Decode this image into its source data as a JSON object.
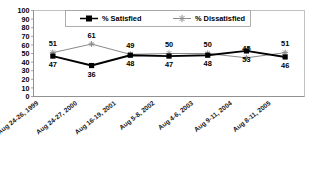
{
  "chart_data": {
    "type": "line",
    "title": "",
    "subtitle": "",
    "xlabel": "",
    "ylabel": "",
    "ylim": [
      0,
      100
    ],
    "ytick_step": 10,
    "yticks": [
      "100",
      "90",
      "80",
      "70",
      "60",
      "50",
      "40",
      "30",
      "20",
      "10",
      "0"
    ],
    "grid": false,
    "legend_position": "top-center",
    "categories": [
      "Aug 24-26, 1999",
      "Aug 24-27, 2000",
      "Aug 16-19, 2001",
      "Aug 5-8, 2002",
      "Aug 4-6, 2003",
      "Aug 9-11, 2004",
      "Aug 8-11, 2005"
    ],
    "series": [
      {
        "name": "% Satisfied",
        "values": [
          47,
          36,
          48,
          47,
          48,
          53,
          46
        ],
        "color": "#000000",
        "marker": "filled-square",
        "label_position": "below"
      },
      {
        "name": "% Dissatisfied",
        "values": [
          51,
          61,
          49,
          50,
          50,
          45,
          51
        ],
        "color": "#8a8a8a",
        "marker": "star",
        "label_position": "above"
      }
    ]
  },
  "legend": {
    "items": [
      {
        "label": "% Satisfied"
      },
      {
        "label": "% Dissatisfied"
      }
    ]
  },
  "axis": {
    "y_tick_labels": [
      "100",
      "90",
      "80",
      "70",
      "60",
      "50",
      "40",
      "30",
      "20",
      "10",
      "0"
    ]
  },
  "labels": {
    "satisfied": [
      "47",
      "36",
      "48",
      "47",
      "48",
      "53",
      "46"
    ],
    "dissatisfied": [
      "51",
      "61",
      "49",
      "50",
      "50",
      "45",
      "51"
    ]
  },
  "colors": {
    "satisfied": "#000000",
    "dissatisfied": "#8a8a8a",
    "axis": "#8c8c8c",
    "frame": "#b4b4b4",
    "background": "#ffffff"
  }
}
